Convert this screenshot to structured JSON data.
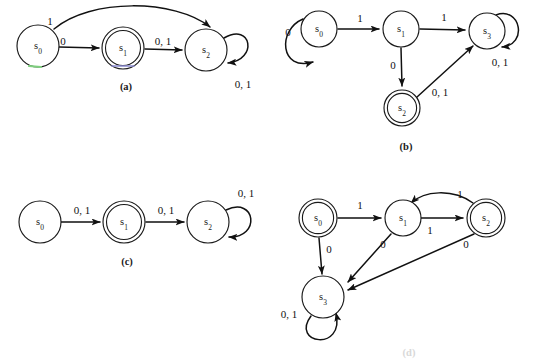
{
  "figure": {
    "background_color": "#ffffff",
    "stroke_color": "#111111",
    "accent_green": "#7fd07f",
    "accent_blue": "#8a8ad0"
  },
  "diagrams": [
    {
      "id": "a",
      "caption": "(a)",
      "caption_x": 126,
      "caption_y": 88,
      "states": [
        {
          "name": "s",
          "sub": "0",
          "cx": 38,
          "cy": 46,
          "r": 21,
          "accepting": false
        },
        {
          "name": "s",
          "sub": "1",
          "cx": 123,
          "cy": 48,
          "r": 21,
          "accepting": true
        },
        {
          "name": "s",
          "sub": "2",
          "cx": 206,
          "cy": 50,
          "r": 21,
          "accepting": false
        }
      ],
      "transitions": [
        {
          "from": "s0",
          "to": "s2",
          "label": "1",
          "label_x": 50,
          "label_y": 22,
          "kind": "curve-over"
        },
        {
          "from": "s0",
          "to": "s1",
          "label": "0",
          "label_x": 63,
          "label_y": 42,
          "kind": "straight"
        },
        {
          "from": "s1",
          "to": "s2",
          "label": "0, 1",
          "label_x": 163,
          "label_y": 44,
          "kind": "straight"
        },
        {
          "from": "s2",
          "to": "s2",
          "label": "0, 1",
          "label_x": 243,
          "label_y": 85,
          "kind": "self-loop-right"
        }
      ]
    },
    {
      "id": "b",
      "caption": "(b)",
      "caption_x": 406,
      "caption_y": 148,
      "states": [
        {
          "name": "s",
          "sub": "0",
          "cx": 319,
          "cy": 29,
          "r": 18,
          "accepting": false
        },
        {
          "name": "s",
          "sub": "1",
          "cx": 401,
          "cy": 29,
          "r": 18,
          "accepting": false
        },
        {
          "name": "s",
          "sub": "3",
          "cx": 487,
          "cy": 31,
          "r": 18,
          "accepting": false
        },
        {
          "name": "s",
          "sub": "2",
          "cx": 402,
          "cy": 108,
          "r": 18,
          "accepting": true
        }
      ],
      "transitions": [
        {
          "from": "s0",
          "to": "s0",
          "label": "0",
          "label_x": 288,
          "label_y": 33,
          "kind": "self-loop-bottom-left"
        },
        {
          "from": "s0",
          "to": "s1",
          "label": "1",
          "label_x": 360,
          "label_y": 20,
          "kind": "straight"
        },
        {
          "from": "s1",
          "to": "s3",
          "label": "1",
          "label_x": 444,
          "label_y": 19,
          "kind": "straight"
        },
        {
          "from": "s1",
          "to": "s2",
          "label": "0",
          "label_x": 393,
          "label_y": 66,
          "kind": "straight"
        },
        {
          "from": "s2",
          "to": "s3",
          "label": "0, 1",
          "label_x": 440,
          "label_y": 92,
          "kind": "straight"
        },
        {
          "from": "s3",
          "to": "s3",
          "label": "0, 1",
          "label_x": 500,
          "label_y": 63,
          "kind": "self-loop-right"
        }
      ]
    },
    {
      "id": "c",
      "caption": "(c)",
      "caption_x": 127,
      "caption_y": 263,
      "states": [
        {
          "name": "s",
          "sub": "0",
          "cx": 40,
          "cy": 222,
          "r": 21,
          "accepting": false
        },
        {
          "name": "s",
          "sub": "1",
          "cx": 124,
          "cy": 222,
          "r": 21,
          "accepting": true
        },
        {
          "name": "s",
          "sub": "2",
          "cx": 208,
          "cy": 222,
          "r": 21,
          "accepting": false
        }
      ],
      "transitions": [
        {
          "from": "s0",
          "to": "s1",
          "label": "0, 1",
          "label_x": 82,
          "label_y": 212,
          "kind": "straight"
        },
        {
          "from": "s1",
          "to": "s2",
          "label": "0, 1",
          "label_x": 166,
          "label_y": 212,
          "kind": "straight"
        },
        {
          "from": "s2",
          "to": "s2",
          "label": "0, 1",
          "label_x": 244,
          "label_y": 195,
          "kind": "self-loop-right"
        }
      ]
    },
    {
      "id": "d",
      "caption": "(d)",
      "caption_x": 409,
      "caption_y": 354,
      "caption_faded": true,
      "states": [
        {
          "name": "s",
          "sub": "0",
          "cx": 318,
          "cy": 218,
          "r": 19,
          "accepting": true
        },
        {
          "name": "s",
          "sub": "1",
          "cx": 403,
          "cy": 218,
          "r": 18,
          "accepting": false
        },
        {
          "name": "s",
          "sub": "2",
          "cx": 486,
          "cy": 218,
          "r": 19,
          "accepting": true
        },
        {
          "name": "s",
          "sub": "3",
          "cx": 323,
          "cy": 297,
          "r": 21,
          "accepting": false
        }
      ],
      "transitions": [
        {
          "from": "s0",
          "to": "s1",
          "label": "1",
          "label_x": 360,
          "label_y": 207,
          "kind": "straight"
        },
        {
          "from": "s0",
          "to": "s3",
          "label": "0",
          "label_x": 328,
          "label_y": 250,
          "kind": "straight"
        },
        {
          "from": "s1",
          "to": "s2",
          "label": "1",
          "label_x": 432,
          "label_y": 231,
          "kind": "straight"
        },
        {
          "from": "s2",
          "to": "s1",
          "label": "1",
          "label_x": 460,
          "label_y": 196,
          "kind": "curve-over"
        },
        {
          "from": "s1",
          "to": "s3",
          "label": "0",
          "label_x": 383,
          "label_y": 245,
          "kind": "straight"
        },
        {
          "from": "s2",
          "to": "s3",
          "label": "0",
          "label_x": 464,
          "label_y": 245,
          "kind": "straight"
        },
        {
          "from": "s3",
          "to": "s3",
          "label": "0, 1",
          "label_x": 289,
          "label_y": 316,
          "kind": "self-loop-bottom"
        }
      ]
    }
  ]
}
